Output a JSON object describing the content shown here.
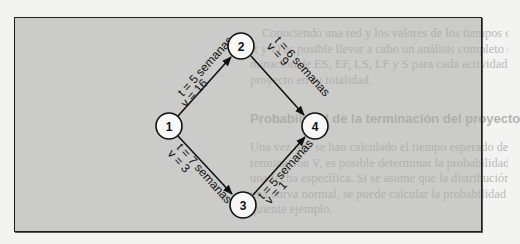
{
  "background_page": {
    "top_paragraph": [
      "Conociendo una red y los valores de los tiempos de las actividades y sus varianzas",
      "(t y v) es posible llevar a cabo un análisis completo de la ruta crítica, incluyendo la deter-",
      "minación de ES, EF, LS, LF y S para cada actividad, así como la ruta crítica, T, y V para el",
      "proyecto en su totalidad."
    ],
    "heading": "Probabilidad de la terminación del proyecto",
    "bottom_paragraph": [
      "Una vez que se han calculado el tiempo esperado de la terminación T y la varianza de la",
      "terminación V, es posible determinar la probabilidad de que el proyecto sea terminado en",
      "una fecha específica. Si se asume que la distribución de las fechas de terminación sigue",
      "una curva normal, se puede calcular la probabilidad de la terminación como en el si-",
      "guiente ejemplo."
    ]
  },
  "diagram": {
    "nodes": [
      {
        "id": "1",
        "label": "1",
        "cx": 169,
        "cy": 126
      },
      {
        "id": "2",
        "label": "2",
        "cx": 241,
        "cy": 46
      },
      {
        "id": "3",
        "label": "3",
        "cx": 243,
        "cy": 205
      },
      {
        "id": "4",
        "label": "4",
        "cx": 315,
        "cy": 126
      }
    ],
    "edges": [
      {
        "from": "1",
        "to": "2",
        "t_label": "t = 5 semanas",
        "v_label": "v = 16"
      },
      {
        "from": "2",
        "to": "4",
        "t_label": "t = 6 semanas",
        "v_label": "v = 9"
      },
      {
        "from": "1",
        "to": "3",
        "t_label": "t = 7 semanas",
        "v_label": "v = 3"
      },
      {
        "from": "3",
        "to": "4",
        "t_label": "t = 5 semanas",
        "v_label": "v = 1"
      }
    ]
  }
}
